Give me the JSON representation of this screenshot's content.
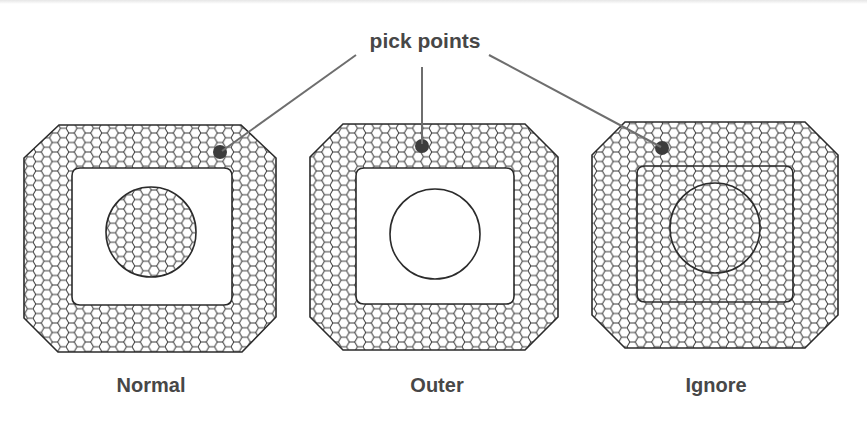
{
  "callout": {
    "text": "pick points"
  },
  "panels": [
    {
      "caption": "Normal",
      "mode": "normal",
      "description": "Outer boundary and island region hatched; gap between them empty"
    },
    {
      "caption": "Outer",
      "mode": "outer",
      "description": "Only the outermost region hatched"
    },
    {
      "caption": "Ignore",
      "mode": "ignore",
      "description": "Entire area hatched, inner boundaries ignored"
    }
  ],
  "colors": {
    "outline": "#2b2b2b",
    "hatch": "#333333",
    "leader_line": "#6e6e6e",
    "pick_point": "#3c3c3c",
    "text": "#474747"
  }
}
